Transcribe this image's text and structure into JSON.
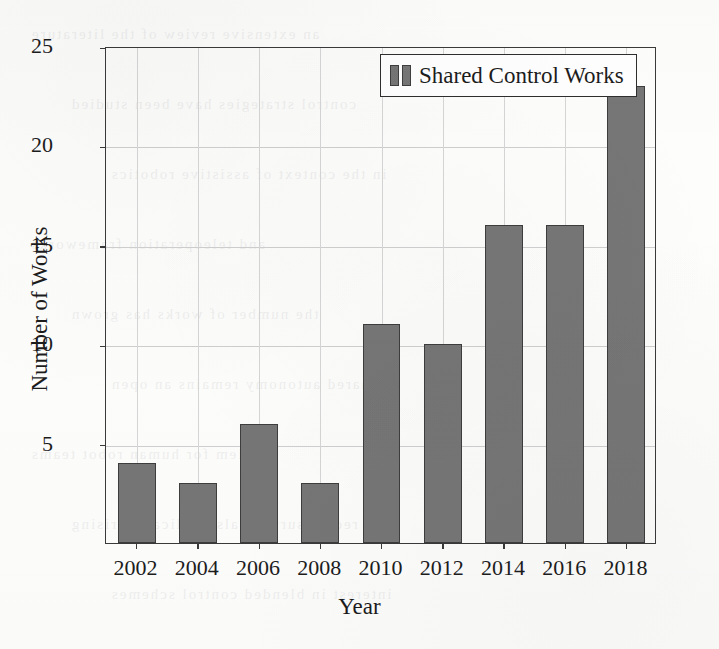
{
  "chart_data": {
    "type": "bar",
    "title": "",
    "xlabel": "Year",
    "ylabel": "Number of Works",
    "categories": [
      "2002",
      "2004",
      "2006",
      "2008",
      "2010",
      "2012",
      "2014",
      "2016",
      "2018"
    ],
    "values": [
      4,
      3,
      6,
      3,
      11,
      10,
      16,
      16,
      23
    ],
    "series": [
      {
        "name": "Shared Control Works",
        "values": [
          4,
          3,
          6,
          3,
          11,
          10,
          16,
          16,
          23
        ]
      }
    ],
    "ylim": [
      0,
      25
    ],
    "ytick_labels": [
      "5",
      "10",
      "15",
      "20",
      "25"
    ],
    "ytick_values": [
      5,
      10,
      15,
      20,
      25
    ],
    "xtick_labels": [
      "2002",
      "2004",
      "2006",
      "2008",
      "2010",
      "2012",
      "2014",
      "2016",
      "2018"
    ],
    "grid": true,
    "legend_position": "top-right",
    "legend_entries": [
      "Shared Control Works"
    ],
    "bar_color": "#767676",
    "bar_edge_color": "#3d3d3d",
    "grid_color": "#cfcfcf",
    "axis_color": "#3a3a3a"
  },
  "legend": {
    "label": "Shared Control Works"
  },
  "axes": {
    "x_title": "Year",
    "y_title": "Number of Works"
  },
  "ghost": {
    "lines": [
      "an extensive review of the literature",
      "control strategies have been studied",
      "in the context of assistive robotics",
      "and teleoperation frameworks",
      "the number of works has grown",
      "shared autonomy remains an open",
      "problem for human robot teams",
      "recent surveys also indicate a rising",
      "interest in blended control schemes"
    ]
  }
}
